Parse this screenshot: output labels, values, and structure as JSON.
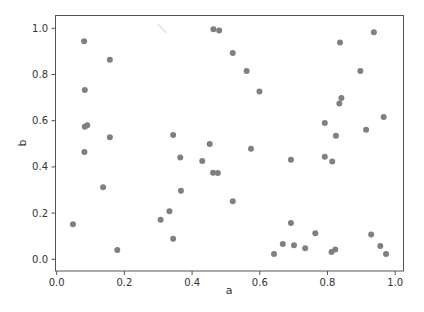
{
  "chart_data": {
    "type": "scatter",
    "title": "",
    "xlabel": "a",
    "ylabel": "b",
    "xlim": [
      -0.0,
      1.03
    ],
    "ylim": [
      -0.03,
      1.05
    ],
    "grid": false,
    "legend": null,
    "xticks": [
      "0.0",
      "0.2",
      "0.4",
      "0.6",
      "0.8",
      "1.0"
    ],
    "yticks": [
      "0.0",
      "0.2",
      "0.4",
      "0.6",
      "0.8",
      "1.0"
    ],
    "marker_color": "#808080",
    "series": [
      {
        "name": "points",
        "points": [
          [
            0.081,
            0.944
          ],
          [
            0.157,
            0.864
          ],
          [
            0.083,
            0.733
          ],
          [
            0.083,
            0.574
          ],
          [
            0.09,
            0.58
          ],
          [
            0.157,
            0.528
          ],
          [
            0.344,
            0.538
          ],
          [
            0.082,
            0.465
          ],
          [
            0.365,
            0.441
          ],
          [
            0.137,
            0.312
          ],
          [
            0.367,
            0.297
          ],
          [
            0.333,
            0.208
          ],
          [
            0.307,
            0.171
          ],
          [
            0.048,
            0.152
          ],
          [
            0.344,
            0.089
          ],
          [
            0.179,
            0.04
          ],
          [
            0.463,
            0.996
          ],
          [
            0.48,
            0.99
          ],
          [
            0.52,
            0.893
          ],
          [
            0.561,
            0.815
          ],
          [
            0.599,
            0.726
          ],
          [
            0.452,
            0.499
          ],
          [
            0.574,
            0.479
          ],
          [
            0.43,
            0.426
          ],
          [
            0.692,
            0.431
          ],
          [
            0.462,
            0.375
          ],
          [
            0.476,
            0.374
          ],
          [
            0.52,
            0.251
          ],
          [
            0.692,
            0.157
          ],
          [
            0.764,
            0.113
          ],
          [
            0.929,
            0.107
          ],
          [
            0.668,
            0.066
          ],
          [
            0.701,
            0.061
          ],
          [
            0.734,
            0.048
          ],
          [
            0.956,
            0.058
          ],
          [
            0.642,
            0.023
          ],
          [
            0.812,
            0.032
          ],
          [
            0.823,
            0.042
          ],
          [
            0.973,
            0.023
          ],
          [
            0.937,
            0.983
          ],
          [
            0.837,
            0.938
          ],
          [
            0.897,
            0.815
          ],
          [
            0.841,
            0.698
          ],
          [
            0.835,
            0.675
          ],
          [
            0.966,
            0.616
          ],
          [
            0.792,
            0.59
          ],
          [
            0.914,
            0.561
          ],
          [
            0.825,
            0.535
          ],
          [
            0.792,
            0.444
          ],
          [
            0.814,
            0.423
          ]
        ]
      }
    ],
    "annotations": [
      {
        "type": "line-segment",
        "color": "#c8c8c8",
        "from": [
          0.298,
          1.02
        ],
        "to": [
          0.323,
          0.98
        ]
      }
    ]
  }
}
